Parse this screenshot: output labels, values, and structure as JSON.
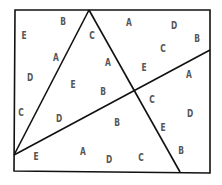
{
  "diagram": {
    "stroke_color": "#111111",
    "label_color": "#555555",
    "frame": {
      "points": [
        [
          15,
          10
        ],
        [
          210,
          10
        ],
        [
          210,
          173
        ],
        [
          14,
          171
        ]
      ]
    },
    "lines": [
      {
        "name": "line-apex-to-left",
        "from": [
          89,
          10
        ],
        "to": [
          14,
          155
        ]
      },
      {
        "name": "line-apex-to-bottom",
        "from": [
          89,
          10
        ],
        "to": [
          180,
          172
        ]
      },
      {
        "name": "line-left-to-right",
        "from": [
          14,
          155
        ],
        "to": [
          210,
          50
        ]
      }
    ],
    "labels": [
      {
        "text": "E",
        "x": 24,
        "y": 36
      },
      {
        "text": "B",
        "x": 63,
        "y": 22
      },
      {
        "text": "C",
        "x": 92,
        "y": 36
      },
      {
        "text": "A",
        "x": 56,
        "y": 58
      },
      {
        "text": "A",
        "x": 129,
        "y": 23
      },
      {
        "text": "D",
        "x": 174,
        "y": 26
      },
      {
        "text": "B",
        "x": 197,
        "y": 39
      },
      {
        "text": "C",
        "x": 163,
        "y": 49
      },
      {
        "text": "A",
        "x": 108,
        "y": 63
      },
      {
        "text": "E",
        "x": 144,
        "y": 68
      },
      {
        "text": "D",
        "x": 30,
        "y": 78
      },
      {
        "text": "E",
        "x": 73,
        "y": 85
      },
      {
        "text": "B",
        "x": 103,
        "y": 92
      },
      {
        "text": "A",
        "x": 189,
        "y": 75
      },
      {
        "text": "C",
        "x": 21,
        "y": 113
      },
      {
        "text": "D",
        "x": 59,
        "y": 119
      },
      {
        "text": "C",
        "x": 152,
        "y": 100
      },
      {
        "text": "B",
        "x": 117,
        "y": 123
      },
      {
        "text": "D",
        "x": 190,
        "y": 114
      },
      {
        "text": "E",
        "x": 163,
        "y": 128
      },
      {
        "text": "A",
        "x": 83,
        "y": 152
      },
      {
        "text": "B",
        "x": 181,
        "y": 151
      },
      {
        "text": "E",
        "x": 36,
        "y": 157
      },
      {
        "text": "D",
        "x": 109,
        "y": 160
      },
      {
        "text": "C",
        "x": 141,
        "y": 158
      }
    ]
  }
}
